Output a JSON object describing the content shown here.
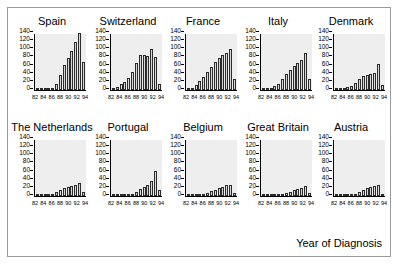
{
  "figure": {
    "x_axis_caption": "Year of Diagnosis",
    "background_color": "#ffffff",
    "panel_border_color": "#9a9a9a",
    "plot_background_color": "#eeeeee",
    "bar_fill_color": "#d8d8d8",
    "bar_edge_color": "#2b2b2b"
  },
  "chart_data": {
    "type": "bar",
    "title": "",
    "subtitle": "",
    "xlabel": "Year of Diagnosis",
    "ylabel": "",
    "grid": false,
    "legend": "none",
    "layout": "small-multiples 2 rows x 5 columns",
    "shared_axes": true,
    "ylim": [
      0,
      140
    ],
    "ytick_labels": [
      "0",
      "20",
      "40",
      "60",
      "80",
      "100",
      "120",
      "140"
    ],
    "ytick_values": [
      0,
      20,
      40,
      60,
      80,
      100,
      120,
      140
    ],
    "xtick_labels": [
      "82",
      "84",
      "86",
      "88",
      "90",
      "92",
      "94"
    ],
    "xtick_values": [
      82,
      84,
      86,
      88,
      90,
      92,
      94
    ],
    "categories": [
      82,
      83,
      84,
      85,
      86,
      87,
      88,
      89,
      90,
      91,
      92,
      93,
      94
    ],
    "xlim": [
      82,
      94
    ],
    "panels": [
      {
        "row": 0,
        "col": 0,
        "title": "Spain",
        "values": [
          1,
          1,
          2,
          3,
          6,
          14,
          38,
          62,
          78,
          95,
          118,
          140,
          68
        ]
      },
      {
        "row": 0,
        "col": 1,
        "title": "Switzerland",
        "values": [
          2,
          8,
          14,
          20,
          30,
          44,
          66,
          85,
          85,
          84,
          100,
          82,
          15
        ]
      },
      {
        "row": 0,
        "col": 2,
        "title": "France",
        "values": [
          3,
          6,
          12,
          22,
          33,
          45,
          57,
          68,
          78,
          86,
          92,
          100,
          28
        ]
      },
      {
        "row": 0,
        "col": 3,
        "title": "Italy",
        "values": [
          2,
          3,
          5,
          10,
          14,
          28,
          40,
          50,
          58,
          66,
          74,
          90,
          28
        ]
      },
      {
        "row": 0,
        "col": 4,
        "title": "Denmark",
        "values": [
          3,
          4,
          5,
          7,
          11,
          18,
          26,
          34,
          38,
          40,
          42,
          65,
          12
        ]
      },
      {
        "row": 1,
        "col": 0,
        "title": "The Netherlands",
        "values": [
          1,
          2,
          2,
          3,
          6,
          10,
          15,
          19,
          22,
          24,
          26,
          32,
          10
        ]
      },
      {
        "row": 1,
        "col": 1,
        "title": "Portugal",
        "values": [
          1,
          1,
          1,
          2,
          3,
          6,
          11,
          17,
          22,
          28,
          38,
          62,
          15
        ]
      },
      {
        "row": 1,
        "col": 2,
        "title": "Belgium",
        "values": [
          1,
          2,
          2,
          3,
          5,
          8,
          12,
          16,
          19,
          23,
          27,
          28,
          8
        ]
      },
      {
        "row": 1,
        "col": 3,
        "title": "Great Britain",
        "values": [
          1,
          1,
          2,
          2,
          3,
          5,
          8,
          11,
          14,
          17,
          20,
          25,
          8
        ]
      },
      {
        "row": 1,
        "col": 4,
        "title": "Austria",
        "values": [
          1,
          1,
          1,
          2,
          2,
          4,
          10,
          15,
          19,
          22,
          24,
          27,
          5
        ]
      }
    ]
  }
}
